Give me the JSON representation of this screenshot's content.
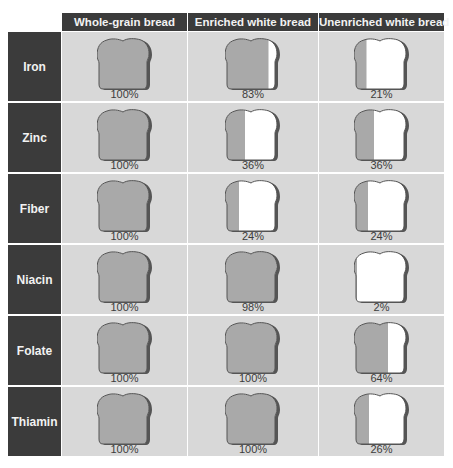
{
  "colors": {
    "header_bg": "#3b3b3b",
    "header_text": "#f2f2f2",
    "cell_bg": "#d8d8d8",
    "bread_fill": "#a9a9a9",
    "bread_crust": "#555555",
    "bread_empty": "#ffffff"
  },
  "columns": [
    "Whole-grain bread",
    "Enriched white bread",
    "Unenriched white bread"
  ],
  "rows": [
    {
      "label": "Iron",
      "values": [
        "100%",
        "83%",
        "21%"
      ]
    },
    {
      "label": "Zinc",
      "values": [
        "100%",
        "36%",
        "36%"
      ]
    },
    {
      "label": "Fiber",
      "values": [
        "100%",
        "24%",
        "24%"
      ]
    },
    {
      "label": "Niacin",
      "values": [
        "100%",
        "98%",
        "2%"
      ]
    },
    {
      "label": "Folate",
      "values": [
        "100%",
        "100%",
        "64%"
      ]
    },
    {
      "label": "Thiamin",
      "values": [
        "100%",
        "100%",
        "26%"
      ]
    }
  ],
  "chart_data": {
    "type": "table",
    "title": "",
    "subtitle": "",
    "categories": [
      "Iron",
      "Zinc",
      "Fiber",
      "Niacin",
      "Folate",
      "Thiamin"
    ],
    "series": [
      {
        "name": "Whole-grain bread",
        "values": [
          100,
          100,
          100,
          100,
          100,
          100
        ]
      },
      {
        "name": "Enriched white bread",
        "values": [
          83,
          36,
          24,
          98,
          100,
          100
        ]
      },
      {
        "name": "Unenriched white bread",
        "values": [
          21,
          36,
          24,
          2,
          64,
          26
        ]
      }
    ],
    "unit": "%",
    "encoding": "Each bread-slice icon is filled (gray) from left to right proportionally to the percentage; the remainder is white.",
    "xlabel": "",
    "ylabel": "",
    "legend": "none",
    "grid": true
  }
}
